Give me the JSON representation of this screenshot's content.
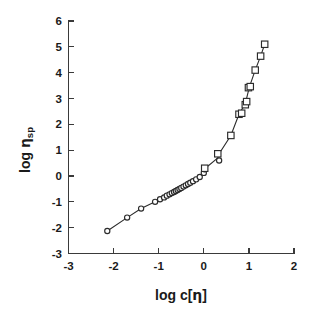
{
  "figure": {
    "background_color": "#ffffff",
    "axis_color": "#3a3a3a",
    "marker_color": "#2b2b2b"
  },
  "chart_data": {
    "type": "scatter",
    "title": "",
    "subtitle": "",
    "xlabel": "log c[η]",
    "ylabel": "log ηsp",
    "ylabel_main": "log",
    "ylabel_greek": "η",
    "ylabel_subscript": "sp",
    "xlabel_main": "log c[",
    "xlabel_greek": "η",
    "xlabel_close": "]",
    "xlim": [
      -3,
      2
    ],
    "ylim": [
      -3,
      6
    ],
    "xticks": [
      -3,
      -2,
      -1,
      0,
      1,
      2
    ],
    "yticks": [
      -3,
      -2,
      -1,
      0,
      1,
      2,
      3,
      4,
      5,
      6
    ],
    "xticklabels": [
      "-3",
      "-2",
      "-1",
      "0",
      "1",
      "2"
    ],
    "yticklabels": [
      "-3",
      "-2",
      "-1",
      "0",
      "1",
      "2",
      "3",
      "4",
      "5",
      "6"
    ],
    "grid": false,
    "legend_position": "none",
    "connected_by_line": true,
    "series": [
      {
        "name": "dilute-regime",
        "marker": "open-circle",
        "marker_size": 5.2,
        "points": [
          {
            "x": -2.14,
            "y": -2.13
          },
          {
            "x": -1.7,
            "y": -1.61
          },
          {
            "x": -1.39,
            "y": -1.26
          },
          {
            "x": -1.08,
            "y": -1.0
          },
          {
            "x": -0.97,
            "y": -0.9
          },
          {
            "x": -0.88,
            "y": -0.83
          },
          {
            "x": -0.82,
            "y": -0.76
          },
          {
            "x": -0.76,
            "y": -0.71
          },
          {
            "x": -0.71,
            "y": -0.66
          },
          {
            "x": -0.66,
            "y": -0.62
          },
          {
            "x": -0.62,
            "y": -0.58
          },
          {
            "x": -0.58,
            "y": -0.54
          },
          {
            "x": -0.54,
            "y": -0.5
          },
          {
            "x": -0.5,
            "y": -0.46
          },
          {
            "x": -0.45,
            "y": -0.41
          },
          {
            "x": -0.4,
            "y": -0.36
          },
          {
            "x": -0.35,
            "y": -0.31
          },
          {
            "x": -0.3,
            "y": -0.26
          },
          {
            "x": -0.24,
            "y": -0.2
          },
          {
            "x": -0.17,
            "y": -0.13
          },
          {
            "x": -0.09,
            "y": -0.04
          },
          {
            "x": 0.0,
            "y": 0.12
          },
          {
            "x": 0.02,
            "y": 0.26
          },
          {
            "x": 0.34,
            "y": 0.6
          }
        ]
      },
      {
        "name": "concentrated-regime",
        "marker": "open-square",
        "marker_size": 6.4,
        "points": [
          {
            "x": 0.02,
            "y": 0.3
          },
          {
            "x": 0.31,
            "y": 0.86
          },
          {
            "x": 0.6,
            "y": 1.57
          },
          {
            "x": 0.78,
            "y": 2.39
          },
          {
            "x": 0.84,
            "y": 2.43
          },
          {
            "x": 0.92,
            "y": 2.76
          },
          {
            "x": 0.95,
            "y": 2.88
          },
          {
            "x": 0.99,
            "y": 3.42
          },
          {
            "x": 1.03,
            "y": 3.46
          },
          {
            "x": 1.14,
            "y": 4.1
          },
          {
            "x": 1.26,
            "y": 4.64
          },
          {
            "x": 1.35,
            "y": 5.1
          }
        ]
      }
    ],
    "curve_path": [
      {
        "x": -2.14,
        "y": -2.13
      },
      {
        "x": -1.7,
        "y": -1.61
      },
      {
        "x": -1.39,
        "y": -1.26
      },
      {
        "x": -1.08,
        "y": -1.0
      },
      {
        "x": -0.88,
        "y": -0.83
      },
      {
        "x": -0.71,
        "y": -0.66
      },
      {
        "x": -0.54,
        "y": -0.5
      },
      {
        "x": -0.35,
        "y": -0.31
      },
      {
        "x": -0.17,
        "y": -0.13
      },
      {
        "x": 0.0,
        "y": 0.12
      },
      {
        "x": 0.02,
        "y": 0.28
      },
      {
        "x": 0.31,
        "y": 0.7
      },
      {
        "x": 0.34,
        "y": 0.86
      },
      {
        "x": 0.6,
        "y": 1.57
      },
      {
        "x": 0.78,
        "y": 2.39
      },
      {
        "x": 0.92,
        "y": 2.8
      },
      {
        "x": 1.01,
        "y": 3.44
      },
      {
        "x": 1.14,
        "y": 4.1
      },
      {
        "x": 1.26,
        "y": 4.64
      },
      {
        "x": 1.35,
        "y": 5.1
      }
    ]
  }
}
